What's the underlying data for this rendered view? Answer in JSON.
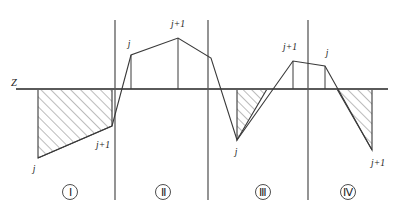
{
  "figure": {
    "datum_label": "Z",
    "colors": {
      "curve": "#3a3a3a",
      "axis": "#5a5a5a",
      "hatch": "#6b6b6b",
      "background": "#ffffff",
      "text": "#1d1d1d"
    }
  },
  "axes": {
    "datum": {
      "label": "Z",
      "y": 89,
      "x_start": 16,
      "x_end": 388
    },
    "dividers": [
      {
        "name": "divider-1",
        "x": 115,
        "y_top": 20,
        "y_bottom": 200
      },
      {
        "name": "divider-2",
        "x": 208,
        "y_top": 20,
        "y_bottom": 200
      },
      {
        "name": "divider-3",
        "x": 308,
        "y_top": 20,
        "y_bottom": 200
      }
    ]
  },
  "regions": [
    {
      "id": "region-1",
      "numeral": "Ⅰ",
      "numeral_x": 70,
      "numeral_y": 192,
      "description": "Both nodes below datum; hatched trapezoid entirely under Z",
      "node_labels": [
        {
          "text": "j",
          "x": 34,
          "y": 172,
          "anchor": "middle"
        },
        {
          "text": "j+1",
          "x": 103,
          "y": 148,
          "anchor": "middle"
        }
      ],
      "hatched": true,
      "hatch_polygon": "38,89 112,89 112,126 38,158",
      "curve_path": "M 38,158 L 112,126"
    },
    {
      "id": "region-2",
      "numeral": "Ⅱ",
      "numeral_x": 163,
      "numeral_y": 192,
      "description": "Both nodes above datum; peak at j+1, no hatching",
      "node_labels": [
        {
          "text": "j",
          "x": 129,
          "y": 47,
          "anchor": "middle"
        },
        {
          "text": "j+1",
          "x": 178,
          "y": 27,
          "anchor": "middle"
        }
      ],
      "hatched": false,
      "curve_path": "M 112,126 L 131,55 L 178,38 L 211,58",
      "ordinates": [
        {
          "x": 131,
          "y_top": 55,
          "y_bottom": 89
        },
        {
          "x": 178,
          "y_top": 38,
          "y_bottom": 89
        }
      ]
    },
    {
      "id": "region-3",
      "numeral": "Ⅲ",
      "numeral_x": 263,
      "numeral_y": 192,
      "description": "Node j below datum, node j+1 above; hatched triangle under Z",
      "node_labels": [
        {
          "text": "j",
          "x": 236,
          "y": 155,
          "anchor": "middle"
        },
        {
          "text": "j+1",
          "x": 290,
          "y": 50,
          "anchor": "middle"
        }
      ],
      "hatched": true,
      "hatch_polygon": "237,140 237,89 267,89",
      "curve_path": "M 211,58 L 237,140 L 293,61 L 325,66",
      "ordinates": [
        {
          "x": 293,
          "y_top": 61,
          "y_bottom": 89
        }
      ]
    },
    {
      "id": "region-4",
      "numeral": "Ⅳ",
      "numeral_x": 348,
      "numeral_y": 192,
      "description": "Node j above datum, node j+1 below; hatched triangle under Z",
      "node_labels": [
        {
          "text": "j",
          "x": 327,
          "y": 56,
          "anchor": "middle"
        },
        {
          "text": "j+1",
          "x": 378,
          "y": 166,
          "anchor": "middle"
        }
      ],
      "hatched": true,
      "hatch_polygon": "337,89 372,89 372,150",
      "curve_path": "M 325,66 L 372,150",
      "ordinates": [
        {
          "x": 325,
          "y_top": 66,
          "y_bottom": 89
        }
      ]
    }
  ]
}
